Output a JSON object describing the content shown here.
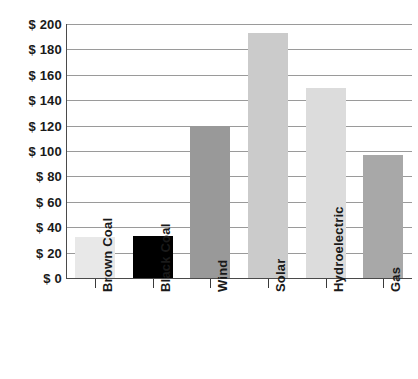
{
  "chart_data": {
    "type": "bar",
    "title": "",
    "subtitle": "",
    "xlabel": "",
    "ylabel": "",
    "categories": [
      "Brown Coal",
      "Black Coal",
      "Wind",
      "Solar",
      "Hydroelectric",
      "Gas"
    ],
    "values": [
      32,
      33,
      120,
      193,
      150,
      97
    ],
    "bar_colors": [
      "#e8e8e8",
      "#000000",
      "#999999",
      "#cbcbcb",
      "#dcdcdc",
      "#a8a8a8"
    ],
    "ylim": [
      0,
      200
    ],
    "ytick_step": 20,
    "ytick_labels": [
      "$ 200",
      "$ 180",
      "$ 160",
      "$ 140",
      "$ 120",
      "$ 100",
      "$ 80",
      "$ 60",
      "$ 40",
      "$ 20",
      "$ 0"
    ],
    "ytick_values": [
      200,
      180,
      160,
      140,
      120,
      100,
      80,
      60,
      40,
      20,
      0
    ],
    "grid": true,
    "legend": false,
    "legend_position": "none",
    "currency_symbol": "$",
    "axis_color": "#4a4a4a",
    "gridline_color": "#9a9a9a",
    "background_color": "#ffffff"
  }
}
